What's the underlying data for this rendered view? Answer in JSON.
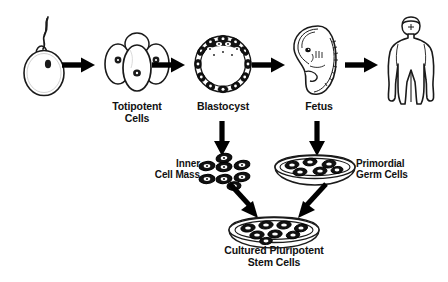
{
  "diagram": {
    "background_color": "#ffffff",
    "ink_color": "#000000"
  },
  "stages": [
    {
      "id": "fertilized-egg",
      "icon": "fertilized-egg-icon",
      "label": "",
      "description": "Sperm fertilizing an ovum with visible nucleus"
    },
    {
      "id": "totipotent-cells",
      "icon": "morula-four-cell-icon",
      "label": "Totipotent\nCells",
      "description": "Four-cell cleavage stage embryo with nuclei"
    },
    {
      "id": "blastocyst",
      "icon": "blastocyst-icon",
      "label": "Blastocyst",
      "description": "Hollow sphere of trophoblast cells with dense inner cell mass"
    },
    {
      "id": "fetus",
      "icon": "fetus-icon",
      "label": "Fetus",
      "description": "Curled fetus in profile"
    },
    {
      "id": "adult",
      "icon": "adult-human-icon",
      "label": "",
      "description": "Adult human body silhouette"
    }
  ],
  "derivations": [
    {
      "id": "inner-cell-mass",
      "icon": "cell-cluster-icon",
      "label": "Inner\nCell Mass",
      "label_position": "left",
      "cell_count": 8,
      "source": "blastocyst"
    },
    {
      "id": "primordial-germ-cells",
      "icon": "petri-dish-icon",
      "label": "Primordial\nGerm Cells",
      "label_position": "right",
      "source": "fetus"
    }
  ],
  "outcome": {
    "id": "cultured-pluripotent-stem-cells",
    "icon": "petri-dish-icon",
    "label": "Cultured Pluripotent\nStem Cells",
    "sources": [
      "inner-cell-mass",
      "primordial-germ-cells"
    ]
  },
  "arrows": [
    {
      "id": "arrow-egg-to-totipotent",
      "direction": "right",
      "from": "fertilized-egg",
      "to": "totipotent-cells"
    },
    {
      "id": "arrow-totipotent-to-blastocyst",
      "direction": "right",
      "from": "totipotent-cells",
      "to": "blastocyst"
    },
    {
      "id": "arrow-blastocyst-to-fetus",
      "direction": "right",
      "from": "blastocyst",
      "to": "fetus"
    },
    {
      "id": "arrow-fetus-to-adult",
      "direction": "right",
      "from": "fetus",
      "to": "adult"
    },
    {
      "id": "arrow-blastocyst-to-icm",
      "direction": "down",
      "from": "blastocyst",
      "to": "inner-cell-mass"
    },
    {
      "id": "arrow-fetus-to-pgc",
      "direction": "down",
      "from": "fetus",
      "to": "primordial-germ-cells"
    },
    {
      "id": "arrow-icm-to-culture",
      "direction": "down-right",
      "from": "inner-cell-mass",
      "to": "cultured-pluripotent-stem-cells"
    },
    {
      "id": "arrow-pgc-to-culture",
      "direction": "down-left",
      "from": "primordial-germ-cells",
      "to": "cultured-pluripotent-stem-cells"
    }
  ]
}
